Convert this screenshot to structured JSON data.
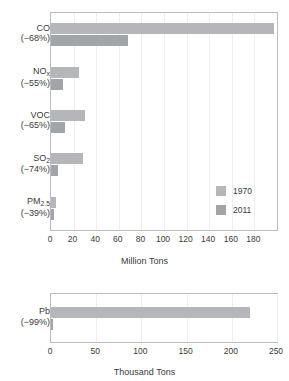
{
  "chart_data": [
    {
      "type": "bar",
      "orientation": "horizontal",
      "title": "",
      "xlabel": "Million Tons",
      "ylabel": "",
      "xlim": [
        0,
        200
      ],
      "xticks": [
        0,
        20,
        40,
        60,
        80,
        100,
        120,
        140,
        160,
        180
      ],
      "grid": true,
      "legend_position": "inside-bottom-right",
      "categories": [
        "CO",
        "NOx",
        "VOC",
        "SO2",
        "PM2.5"
      ],
      "category_labels": [
        {
          "name": "CO",
          "sub": "",
          "change": "(−68%)"
        },
        {
          "name": "NO",
          "sub": "x",
          "change": "(−55%)"
        },
        {
          "name": "VOC",
          "sub": "",
          "change": "(−65%)"
        },
        {
          "name": "SO",
          "sub": "2",
          "change": "(−74%)"
        },
        {
          "name": "PM",
          "sub": "2.5",
          "change": "(−39%)"
        }
      ],
      "series": [
        {
          "name": "1970",
          "color": "#b4b6b9",
          "values": [
            197,
            25,
            30,
            28,
            4
          ]
        },
        {
          "name": "2011",
          "color": "#a2a5a8",
          "values": [
            68,
            11,
            12,
            6,
            3
          ]
        }
      ]
    },
    {
      "type": "bar",
      "orientation": "horizontal",
      "title": "",
      "xlabel": "Thousand Tons",
      "ylabel": "",
      "xlim": [
        0,
        250
      ],
      "xticks": [
        0,
        50,
        100,
        150,
        200,
        250
      ],
      "grid": true,
      "legend_position": "none",
      "categories": [
        "Pb"
      ],
      "category_labels": [
        {
          "name": "Pb",
          "sub": "",
          "change": "(−99%)"
        }
      ],
      "series": [
        {
          "name": "1970",
          "color": "#b4b6b9",
          "values": [
            220
          ]
        },
        {
          "name": "2011",
          "color": "#a2a5a8",
          "values": [
            2
          ]
        }
      ]
    }
  ]
}
